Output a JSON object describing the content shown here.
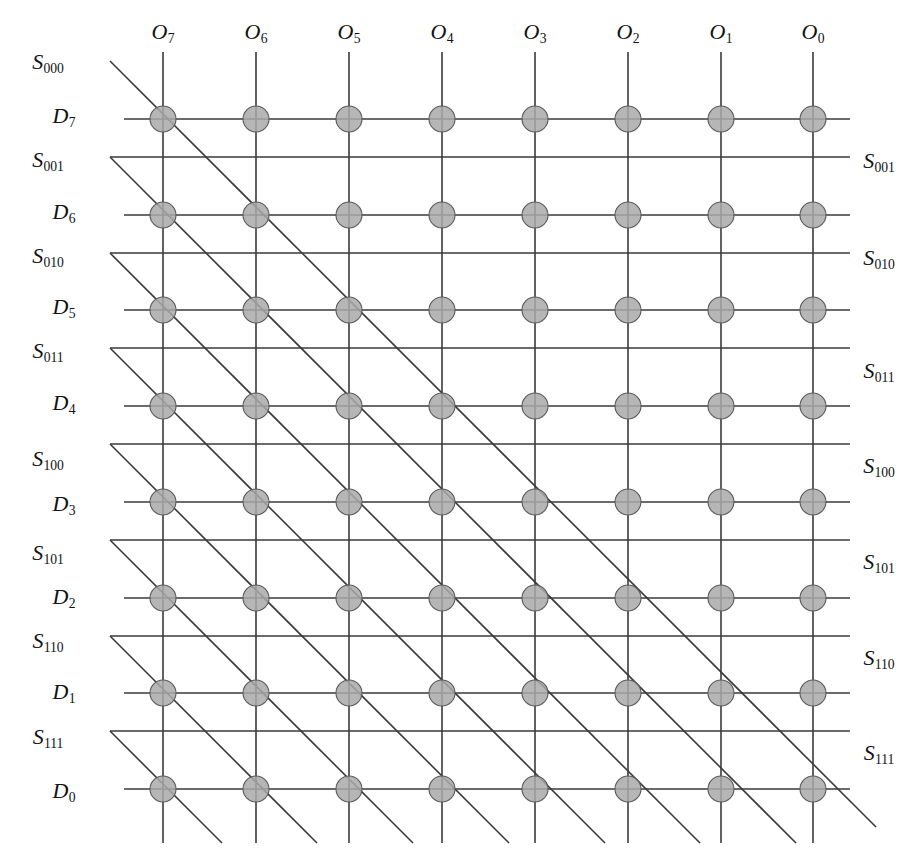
{
  "figure": {
    "kind": "crossbar-switch-matrix",
    "colors": {
      "line": "#3a3a3a",
      "node_fill": "#a9a9a9",
      "node_stroke": "#5a5a5a",
      "text": "#121212",
      "background": "#ffffff"
    }
  },
  "geometry": {
    "columns": 8,
    "data_rows": 8,
    "select_rows": 8,
    "column_x": [
      163,
      256,
      349,
      442,
      535,
      628,
      721,
      813
    ],
    "data_row_y": [
      119,
      215,
      310,
      406,
      502,
      598,
      693,
      789
    ],
    "select_row_y": [
      61,
      157,
      253,
      348,
      444,
      540,
      636,
      731
    ],
    "grid_left": 110,
    "grid_right": 856,
    "vertical_top": 52,
    "vertical_bottom": 843,
    "node_radius": 13,
    "diagonal_slope": 1.0
  },
  "column_headers": [
    {
      "base": "O",
      "sub": "7",
      "x": 163,
      "y": 32
    },
    {
      "base": "O",
      "sub": "6",
      "x": 256,
      "y": 32
    },
    {
      "base": "O",
      "sub": "5",
      "x": 349,
      "y": 32
    },
    {
      "base": "O",
      "sub": "4",
      "x": 442,
      "y": 32
    },
    {
      "base": "O",
      "sub": "3",
      "x": 535,
      "y": 32
    },
    {
      "base": "O",
      "sub": "2",
      "x": 628,
      "y": 32
    },
    {
      "base": "O",
      "sub": "1",
      "x": 721,
      "y": 32
    },
    {
      "base": "O",
      "sub": "0",
      "x": 813,
      "y": 32
    }
  ],
  "left_labels": [
    {
      "base": "S",
      "sub": "000",
      "x": 48,
      "y": 62,
      "type": "select"
    },
    {
      "base": "D",
      "sub": "7",
      "x": 64,
      "y": 116,
      "type": "data"
    },
    {
      "base": "S",
      "sub": "001",
      "x": 48,
      "y": 160,
      "type": "select"
    },
    {
      "base": "D",
      "sub": "6",
      "x": 64,
      "y": 212,
      "type": "data"
    },
    {
      "base": "S",
      "sub": "010",
      "x": 48,
      "y": 256,
      "type": "select"
    },
    {
      "base": "D",
      "sub": "5",
      "x": 64,
      "y": 307,
      "type": "data"
    },
    {
      "base": "S",
      "sub": "011",
      "x": 48,
      "y": 351,
      "type": "select"
    },
    {
      "base": "D",
      "sub": "4",
      "x": 64,
      "y": 403,
      "type": "data"
    },
    {
      "base": "S",
      "sub": "100",
      "x": 48,
      "y": 459,
      "type": "select"
    },
    {
      "base": "D",
      "sub": "3",
      "x": 64,
      "y": 504,
      "type": "data"
    },
    {
      "base": "S",
      "sub": "101",
      "x": 48,
      "y": 553,
      "type": "select"
    },
    {
      "base": "D",
      "sub": "2",
      "x": 64,
      "y": 597,
      "type": "data"
    },
    {
      "base": "S",
      "sub": "110",
      "x": 48,
      "y": 641,
      "type": "select"
    },
    {
      "base": "D",
      "sub": "1",
      "x": 64,
      "y": 692,
      "type": "data"
    },
    {
      "base": "S",
      "sub": "111",
      "x": 48,
      "y": 737,
      "type": "select"
    },
    {
      "base": "D",
      "sub": "0",
      "x": 64,
      "y": 791,
      "type": "data"
    }
  ],
  "right_labels": [
    {
      "base": "S",
      "sub": "001",
      "x": 879,
      "y": 161
    },
    {
      "base": "S",
      "sub": "010",
      "x": 879,
      "y": 258
    },
    {
      "base": "S",
      "sub": "011",
      "x": 879,
      "y": 371
    },
    {
      "base": "S",
      "sub": "100",
      "x": 879,
      "y": 466
    },
    {
      "base": "S",
      "sub": "101",
      "x": 879,
      "y": 562
    },
    {
      "base": "S",
      "sub": "110",
      "x": 879,
      "y": 658
    },
    {
      "base": "S",
      "sub": "111",
      "x": 879,
      "y": 753
    }
  ],
  "node_grid": {
    "rows": [
      "D7",
      "D6",
      "D5",
      "D4",
      "D3",
      "D2",
      "D1",
      "D0"
    ],
    "cols": [
      "O7",
      "O6",
      "O5",
      "O4",
      "O3",
      "O2",
      "O1",
      "O0"
    ],
    "all_crosspoints_present": true
  }
}
